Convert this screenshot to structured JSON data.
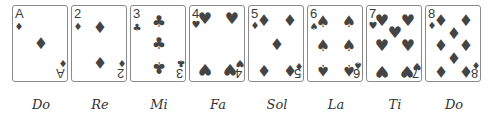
{
  "cards": [
    {
      "rank": "A",
      "suit": "diamond",
      "glyph": "♦",
      "label": "Do"
    },
    {
      "rank": "2",
      "suit": "diamond",
      "glyph": "♦",
      "label": "Re"
    },
    {
      "rank": "3",
      "suit": "club",
      "glyph": "♣",
      "label": "Mi"
    },
    {
      "rank": "4",
      "suit": "heart",
      "glyph": "♥",
      "label": "Fa"
    },
    {
      "rank": "5",
      "suit": "diamond",
      "glyph": "♦",
      "label": "Sol"
    },
    {
      "rank": "6",
      "suit": "spade",
      "glyph": "♠",
      "label": "La"
    },
    {
      "rank": "7",
      "suit": "heart",
      "glyph": "♥",
      "label": "Ti"
    },
    {
      "rank": "8",
      "suit": "diamond",
      "glyph": "♦",
      "label": "Do"
    }
  ],
  "colors": {
    "border": "#8a8a8a",
    "pip": "#444444",
    "label": "#333333"
  }
}
